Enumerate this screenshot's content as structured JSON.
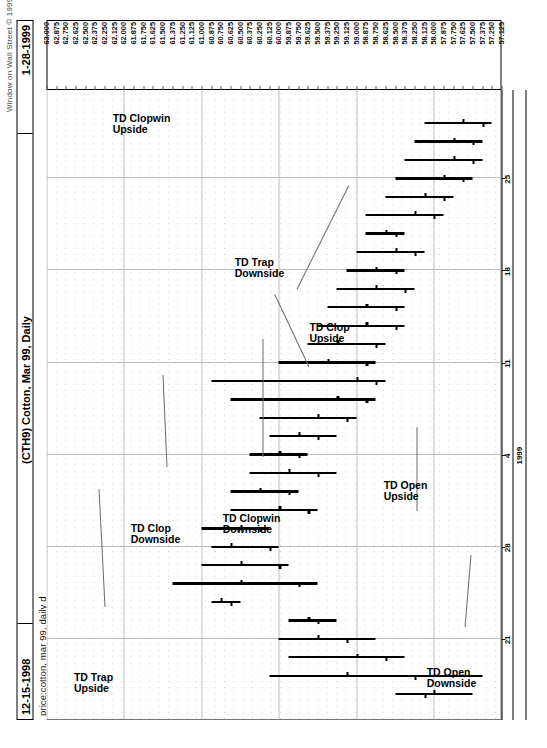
{
  "header": {
    "copyright": "Window on Wall Street © 1999",
    "date_left": "12-15-1998",
    "title": "(CTH9) Cotton, Mar 99, Daily",
    "date_right": "1-28-1999",
    "subtitle": "price:cotton, mar 99, daily d"
  },
  "annotations": [
    {
      "id": "td-trap-upside",
      "line1": "TD Trap",
      "line2": "Upside"
    },
    {
      "id": "td-clop-downside",
      "line1": "TD Clop",
      "line2": "Downside"
    },
    {
      "id": "td-clopwin-upside",
      "line1": "TD Clopwin",
      "line2": "Upside"
    },
    {
      "id": "td-trap-downside",
      "line1": "TD Trap",
      "line2": "Downside"
    },
    {
      "id": "td-clop-upside",
      "line1": "TD Clop",
      "line2": "Upside"
    },
    {
      "id": "td-clopwin-downside",
      "line1": "TD Clopwin",
      "line2": "Downside"
    },
    {
      "id": "td-open-upside",
      "line1": "TD Open",
      "line2": "Upside"
    },
    {
      "id": "td-open-downside",
      "line1": "TD Open",
      "line2": "Downside"
    }
  ],
  "chart_data": {
    "type": "ohlc",
    "title": "(CTH9) Cotton, Mar 99, Daily",
    "subtitle": "price:cotton, mar 99, daily d",
    "source": "Window on Wall Street © 1999",
    "date_range_start": "12-15-1998",
    "date_range_end": "1-28-1999",
    "xlabel": "",
    "ylabel": "",
    "grid": true,
    "legend": "none",
    "ylim": [
      57.125,
      63.0
    ],
    "ytick_step": 0.125,
    "ytick_labels": [
      "63.000",
      "62.875",
      "62.750",
      "62.625",
      "62.500",
      "62.375",
      "62.250",
      "62.125",
      "62.000",
      "61.875",
      "61.750",
      "61.625",
      "61.500",
      "61.375",
      "61.250",
      "61.125",
      "61.000",
      "60.875",
      "60.750",
      "60.625",
      "60.500",
      "60.375",
      "60.250",
      "60.125",
      "60.000",
      "59.875",
      "59.750",
      "59.625",
      "59.500",
      "59.375",
      "59.250",
      "59.125",
      "59.000",
      "58.875",
      "58.750",
      "58.625",
      "58.500",
      "58.375",
      "58.250",
      "58.125",
      "58.000",
      "57.875",
      "57.750",
      "57.625",
      "57.500",
      "57.375",
      "57.250",
      "57.125"
    ],
    "xtick_labels": [
      "21",
      "28",
      "4",
      "11",
      "18",
      "25"
    ],
    "xtick_year_label": "1999",
    "xtick_indices": [
      3,
      8,
      13,
      18,
      23,
      28
    ],
    "bars": [
      {
        "i": 0,
        "open": 58.125,
        "high": 58.5,
        "low": 57.5,
        "close": 58.0
      },
      {
        "i": 1,
        "open": 58.25,
        "high": 60.125,
        "low": 57.375,
        "close": 59.125
      },
      {
        "i": 2,
        "open": 58.625,
        "high": 59.875,
        "low": 58.375,
        "close": 59.0
      },
      {
        "i": 3,
        "open": 59.125,
        "high": 60.0,
        "low": 58.75,
        "close": 59.5
      },
      {
        "i": 4,
        "open": 59.5,
        "high": 59.875,
        "low": 59.25,
        "close": 59.625
      },
      {
        "i": 5,
        "open": 60.625,
        "high": 60.875,
        "low": 60.5,
        "close": 60.75
      },
      {
        "i": 6,
        "open": 59.75,
        "high": 61.375,
        "low": 59.5,
        "close": 60.5
      },
      {
        "i": 7,
        "open": 60.0,
        "high": 61.0,
        "low": 59.875,
        "close": 60.5
      },
      {
        "i": 8,
        "open": 60.125,
        "high": 60.875,
        "low": 60.0,
        "close": 60.625
      },
      {
        "i": 9,
        "open": 60.25,
        "high": 61.0,
        "low": 60.125,
        "close": 60.5
      },
      {
        "i": 10,
        "open": 59.625,
        "high": 60.625,
        "low": 59.5,
        "close": 60.0
      },
      {
        "i": 11,
        "open": 59.875,
        "high": 60.625,
        "low": 59.75,
        "close": 60.25
      },
      {
        "i": 12,
        "open": 59.5,
        "high": 60.375,
        "low": 59.25,
        "close": 59.875
      },
      {
        "i": 13,
        "open": 59.75,
        "high": 60.375,
        "low": 59.625,
        "close": 60.0
      },
      {
        "i": 14,
        "open": 59.5,
        "high": 60.125,
        "low": 59.25,
        "close": 59.75
      },
      {
        "i": 15,
        "open": 59.125,
        "high": 60.25,
        "low": 59.0,
        "close": 59.5
      },
      {
        "i": 16,
        "open": 58.875,
        "high": 60.625,
        "low": 58.75,
        "close": 59.25
      },
      {
        "i": 17,
        "open": 58.75,
        "high": 60.875,
        "low": 58.625,
        "close": 59.0
      },
      {
        "i": 18,
        "open": 58.875,
        "high": 60.0,
        "low": 58.75,
        "close": 59.375
      },
      {
        "i": 19,
        "open": 58.75,
        "high": 59.625,
        "low": 58.625,
        "close": 59.25
      },
      {
        "i": 20,
        "open": 58.5,
        "high": 59.5,
        "low": 58.375,
        "close": 58.875
      },
      {
        "i": 21,
        "open": 58.5,
        "high": 59.375,
        "low": 58.375,
        "close": 58.875
      },
      {
        "i": 22,
        "open": 58.375,
        "high": 59.25,
        "low": 58.25,
        "close": 58.75
      },
      {
        "i": 23,
        "open": 58.5,
        "high": 59.125,
        "low": 58.375,
        "close": 58.75
      },
      {
        "i": 24,
        "open": 58.25,
        "high": 59.0,
        "low": 58.125,
        "close": 58.5
      },
      {
        "i": 25,
        "open": 58.5,
        "high": 58.875,
        "low": 58.375,
        "close": 58.625
      },
      {
        "i": 26,
        "open": 58.0,
        "high": 58.875,
        "low": 57.875,
        "close": 58.25
      },
      {
        "i": 27,
        "open": 57.875,
        "high": 58.625,
        "low": 57.75,
        "close": 58.125
      },
      {
        "i": 28,
        "open": 57.625,
        "high": 58.5,
        "low": 57.5,
        "close": 57.875
      },
      {
        "i": 29,
        "open": 57.5,
        "high": 58.375,
        "low": 57.375,
        "close": 57.75
      },
      {
        "i": 30,
        "open": 57.5,
        "high": 58.25,
        "low": 57.375,
        "close": 57.75
      },
      {
        "i": 31,
        "open": 57.375,
        "high": 58.125,
        "low": 57.25,
        "close": 57.625
      }
    ]
  }
}
